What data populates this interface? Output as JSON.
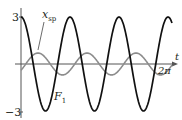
{
  "chart_data": {
    "type": "line",
    "title": "",
    "xlabel": "t",
    "ylabel": "",
    "xlim": [
      0,
      6.2832
    ],
    "ylim": [
      -3,
      3
    ],
    "x_tick_labels": [
      "2π"
    ],
    "y_tick_labels": [
      "3",
      "-3"
    ],
    "grid": false,
    "legend": "inline annotations",
    "series": [
      {
        "name": "F1",
        "label": "F",
        "label_sub": "1",
        "color": "#000000",
        "amplitude": 3,
        "cycles_over_2pi": 3.15,
        "phase": "cosine, starts at max",
        "x": [
          0,
          1.0,
          2.0,
          3.0,
          4.0,
          5.0,
          6.0,
          6.2832
        ],
        "values": [
          3,
          -0.2,
          -2.8,
          0.6,
          2.5,
          -1.2,
          -2.1,
          2.8
        ]
      },
      {
        "name": "x_sp",
        "label": "x",
        "label_sub": "sp",
        "color": "#8a8a8a",
        "amplitude": 0.7,
        "cycles_over_2pi": 3.15,
        "phase": "lagging F1",
        "x": [
          0,
          1.0,
          2.0,
          3.0,
          4.0,
          5.0,
          6.0,
          6.2832
        ],
        "values": [
          -0.4,
          0.6,
          -0.5,
          0.7,
          -0.6,
          0.5,
          -0.5,
          0.1
        ]
      }
    ],
    "annotations": [
      {
        "text": "x_sp",
        "points_to": "gray curve"
      },
      {
        "text": "F1",
        "points_to": "black curve"
      }
    ]
  },
  "labels": {
    "y_top": "3",
    "y_bottom": "−3",
    "x_axis": "t",
    "x_tick": "2π",
    "x_tick_pre": "2",
    "x_tick_pi": "π",
    "xsp_main": "x",
    "xsp_sub": "sp",
    "f1_main": "F",
    "f1_sub": "1"
  }
}
